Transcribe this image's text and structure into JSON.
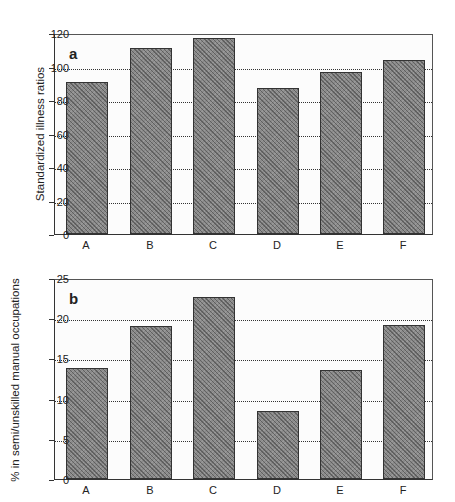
{
  "chart_data": [
    {
      "type": "bar",
      "panel": "a",
      "title": "",
      "xlabel": "",
      "ylabel": "Standardized illness ratios",
      "categories": [
        "A",
        "B",
        "C",
        "D",
        "E",
        "F"
      ],
      "values": [
        91,
        111,
        117,
        87,
        97,
        104
      ],
      "ylim": [
        0,
        120
      ],
      "yticks": [
        "0",
        "20",
        "40",
        "60",
        "80",
        "100",
        "120"
      ],
      "grid": true,
      "legend": null
    },
    {
      "type": "bar",
      "panel": "b",
      "title": "",
      "xlabel": "",
      "ylabel": "% in semi/unskilled manual occupations",
      "categories": [
        "A",
        "B",
        "C",
        "D",
        "E",
        "F"
      ],
      "values": [
        13.8,
        19.0,
        22.6,
        8.5,
        13.6,
        19.2
      ],
      "ylim": [
        0,
        25
      ],
      "yticks": [
        "0",
        "5",
        "10",
        "15",
        "20",
        "25"
      ],
      "grid": true,
      "legend": null
    }
  ],
  "panels": {
    "a": {
      "letter": "a",
      "ylabel": "Standardized illness ratios"
    },
    "b": {
      "letter": "b",
      "ylabel": "% in semi/unskilled manual occupations"
    }
  }
}
